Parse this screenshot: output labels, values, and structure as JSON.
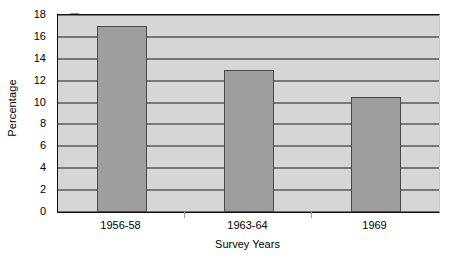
{
  "chart_data": {
    "type": "bar",
    "title": "",
    "subtitle": "",
    "xlabel": "Survey Years",
    "ylabel": "Percentage",
    "categories": [
      "1956-58",
      "1963-64",
      "1969"
    ],
    "values": [
      17,
      13,
      10.5
    ],
    "series": [
      {
        "name": "Percentage",
        "values": [
          17,
          13,
          10.5
        ]
      }
    ],
    "ylim": [
      0,
      18
    ],
    "yticks": [
      0,
      2,
      4,
      6,
      8,
      10,
      12,
      14,
      16,
      18
    ],
    "ytick_labels": [
      "0",
      "2",
      "4",
      "6",
      "8",
      "10",
      "12",
      "14",
      "16",
      "18"
    ],
    "grid": true,
    "grid_axis": "y",
    "legend": false,
    "legend_position": "none",
    "annotations": [],
    "colors": {
      "bar_fill": "#9e9e9e",
      "bar_edge": "#4a4a4a",
      "plot_background": "#d6d6d6",
      "gridline": "#1a1a1a",
      "axis": "#111111",
      "text": "#000000",
      "figure_background": "#ffffff"
    }
  }
}
